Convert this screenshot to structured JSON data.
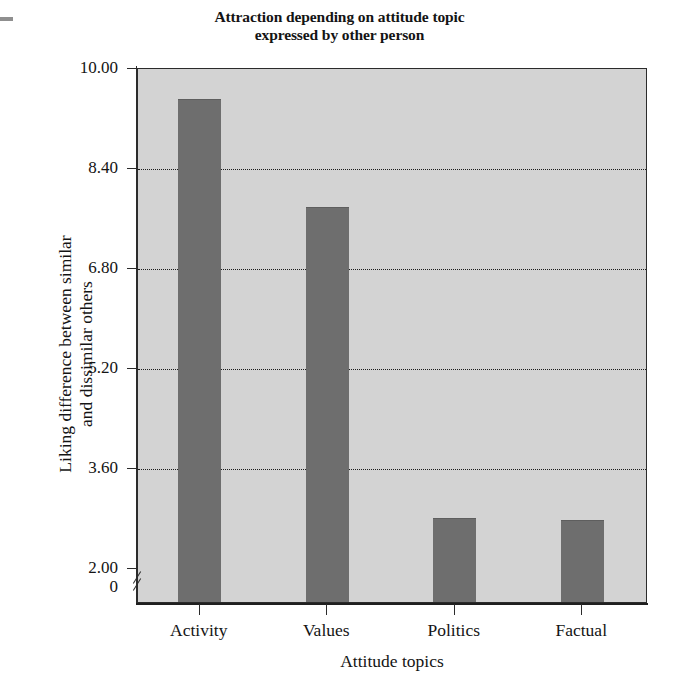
{
  "chart_data": {
    "type": "bar",
    "title": "Attraction depending on attitude topic expressed by other person",
    "title_lines": [
      "Attraction depending on attitude topic",
      "expressed by other person"
    ],
    "xlabel": "Attitude topics",
    "ylabel": "Liking difference between similar and dissimilar others",
    "ylabel_lines": [
      "Liking difference between similar",
      "and dissimilar others"
    ],
    "categories": [
      "Activity",
      "Values",
      "Politics",
      "Factual"
    ],
    "values": [
      9.48,
      7.75,
      2.77,
      2.73
    ],
    "ylim": [
      2.0,
      10.0
    ],
    "y_ticks": [
      10.0,
      8.4,
      6.8,
      5.2,
      3.6,
      2.0
    ],
    "y_tick_labels": [
      "10.00",
      "8.40",
      "6.80",
      "5.20",
      "3.60",
      "2.00"
    ],
    "y_origin_label": "0",
    "axis_break": true,
    "grid": "horizontal-dotted",
    "gridline_values": [
      8.4,
      6.8,
      5.2,
      3.6
    ],
    "legend": null,
    "colors": {
      "bar": "#6e6e6e",
      "plot_background": "#d3d3d3",
      "figure_background": "#ffffff",
      "axis": "#2b2b2b",
      "gridline": "#1c1c1c",
      "text": "#141414"
    }
  }
}
